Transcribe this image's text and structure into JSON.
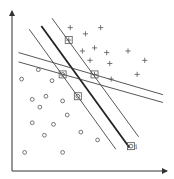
{
  "diagram": {
    "title": "",
    "classes": {
      "positive": {
        "marker": "plus"
      },
      "negative": {
        "marker": "circle"
      }
    },
    "coordinate_space": {
      "x": [
        0,
        100
      ],
      "y": [
        0,
        100
      ]
    },
    "lines": [
      {
        "id": "optimal-hyperplane",
        "style": "thick",
        "from": [
          18,
          91
        ],
        "to": [
          76,
          13
        ]
      },
      {
        "id": "margin-lower",
        "style": "thin",
        "from": [
          10,
          89
        ],
        "to": [
          67,
          12
        ]
      },
      {
        "id": "margin-upper",
        "style": "thin",
        "from": [
          25,
          96
        ],
        "to": [
          82,
          20
        ]
      },
      {
        "id": "alt-hyperplane-upper",
        "style": "thin",
        "from": [
          3,
          74
        ],
        "to": [
          98,
          47
        ]
      },
      {
        "id": "alt-hyperplane-lower",
        "style": "thin",
        "from": [
          3,
          68
        ],
        "to": [
          98,
          42
        ]
      }
    ],
    "plus_points": [
      [
        37,
        90
      ],
      [
        47,
        86
      ],
      [
        57,
        90
      ],
      [
        45,
        75
      ],
      [
        53,
        77
      ],
      [
        61,
        74
      ],
      [
        75,
        75
      ],
      [
        86,
        69
      ],
      [
        50,
        69
      ],
      [
        63,
        67
      ],
      [
        81,
        60
      ],
      [
        64,
        57
      ]
    ],
    "circle_points": [
      [
        16,
        63
      ],
      [
        5,
        57
      ],
      [
        25,
        56
      ],
      [
        12,
        44
      ],
      [
        21,
        46
      ],
      [
        32,
        43
      ],
      [
        17,
        39
      ],
      [
        12,
        29
      ],
      [
        26,
        28
      ],
      [
        35,
        34
      ],
      [
        20,
        21
      ],
      [
        44,
        23
      ],
      [
        55,
        18
      ],
      [
        7,
        10
      ],
      [
        32,
        10
      ]
    ],
    "support_vectors": [
      {
        "class": "positive",
        "at": [
          36,
          82
        ]
      },
      {
        "class": "negative",
        "at": [
          32,
          60
        ]
      },
      {
        "class": "positive",
        "at": [
          53,
          60
        ]
      },
      {
        "class": "negative",
        "at": [
          42,
          46
        ]
      },
      {
        "class": "negative",
        "at": [
          77,
          14
        ],
        "label": "i"
      }
    ]
  }
}
